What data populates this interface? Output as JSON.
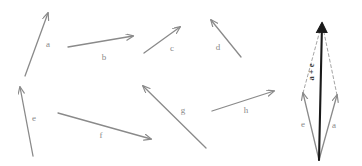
{
  "figure": {
    "background": "#ffffff",
    "arrow_color": "#8a8a8a",
    "resultant_color": "#1a1a1a",
    "dashed_color": "#9a9a9a",
    "label_color": "#8a8a8a"
  },
  "free_vectors": [
    {
      "id": "a",
      "label": "a",
      "x1": 25,
      "y1": 76,
      "x2": 48,
      "y2": 13,
      "lx": 48,
      "ly": 47
    },
    {
      "id": "b",
      "label": "b",
      "x1": 68,
      "y1": 47,
      "x2": 133,
      "y2": 36,
      "lx": 104,
      "ly": 60
    },
    {
      "id": "c",
      "label": "c",
      "x1": 144,
      "y1": 53,
      "x2": 180,
      "y2": 27,
      "lx": 172,
      "ly": 51
    },
    {
      "id": "d",
      "label": "d",
      "x1": 241,
      "y1": 57,
      "x2": 211,
      "y2": 20,
      "lx": 218,
      "ly": 50
    },
    {
      "id": "e",
      "label": "e",
      "x1": 33,
      "y1": 156,
      "x2": 20,
      "y2": 87,
      "lx": 34,
      "ly": 121
    },
    {
      "id": "f",
      "label": "f",
      "x1": 58,
      "y1": 113,
      "x2": 151,
      "y2": 139,
      "lx": 101,
      "ly": 138
    },
    {
      "id": "g",
      "label": "g",
      "x1": 206,
      "y1": 148,
      "x2": 143,
      "y2": 86,
      "lx": 183,
      "ly": 113
    },
    {
      "id": "h",
      "label": "h",
      "x1": 212,
      "y1": 111,
      "x2": 274,
      "y2": 91,
      "lx": 246,
      "ly": 113
    }
  ],
  "parallelogram": {
    "origin": {
      "x": 319,
      "y": 160
    },
    "vector_e": {
      "label": "e",
      "x2": 303,
      "y2": 93,
      "lx": 303,
      "ly": 127
    },
    "vector_a": {
      "label": "a",
      "x2": 337,
      "y2": 95,
      "lx": 333,
      "ly": 128
    },
    "resultant": {
      "label": "a + e",
      "x2": 322,
      "y2": 22,
      "lx": 316,
      "ly": 72
    },
    "dashed_from_e": {
      "x1": 303,
      "y1": 93,
      "x2": 322,
      "y2": 23
    },
    "dashed_from_a": {
      "x1": 337,
      "y1": 95,
      "x2": 322,
      "y2": 23
    }
  }
}
